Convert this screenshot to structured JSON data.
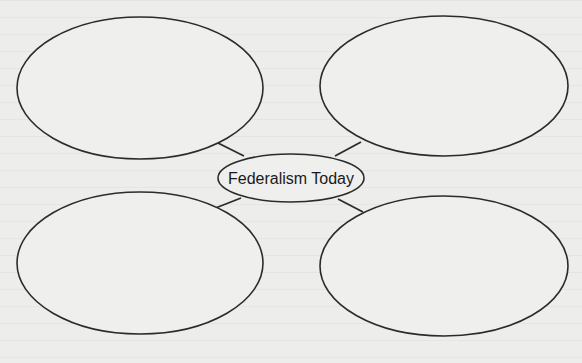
{
  "diagram": {
    "type": "concept-web",
    "center": {
      "label": "Federalism Today"
    },
    "outer_bubbles": [
      {
        "position": "top-left",
        "label": ""
      },
      {
        "position": "top-right",
        "label": ""
      },
      {
        "position": "bottom-left",
        "label": ""
      },
      {
        "position": "bottom-right",
        "label": ""
      }
    ],
    "colors": {
      "background": "#ededeb",
      "stroke": "#2b2b2b",
      "text": "#1a1a1a"
    }
  }
}
